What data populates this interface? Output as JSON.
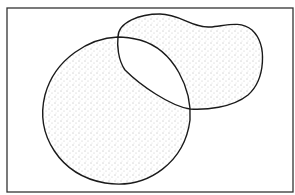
{
  "figure": {
    "type": "venn-symmetric-difference",
    "regions": [
      {
        "name": "A",
        "shape": "circle",
        "shaded": true
      },
      {
        "name": "B",
        "shape": "kidney",
        "shaded": true
      }
    ],
    "intersection_shaded": false,
    "colors": {
      "outline": "#1a1a1a",
      "stipple": "#555555",
      "frame": "#333333",
      "background": "#ffffff"
    }
  }
}
